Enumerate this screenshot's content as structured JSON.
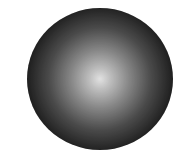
{
  "image": {
    "subject": "shaded sphere",
    "style": "halftone radial gradient",
    "colors": {
      "background": "#ffffff",
      "highlight": "#ffffff",
      "shadow": "#000000"
    }
  }
}
